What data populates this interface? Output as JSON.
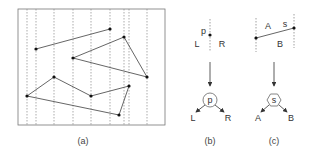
{
  "colors": {
    "stroke": "#555555",
    "dashed": "#888888",
    "point": "#111111",
    "text": "#333333"
  },
  "panel_a": {
    "caption": "(a)",
    "frame": {
      "x": 18,
      "y": 9,
      "w": 147,
      "h": 116
    },
    "sweep_lines_x": [
      27,
      36,
      54,
      73,
      91,
      110,
      124,
      129,
      147
    ],
    "segments": [
      [
        [
          36,
          49
        ],
        [
          110,
          29
        ]
      ],
      [
        [
          73,
          58
        ],
        [
          124,
          37
        ]
      ],
      [
        [
          124,
          37
        ],
        [
          147,
          77
        ]
      ],
      [
        [
          73,
          58
        ],
        [
          147,
          77
        ]
      ],
      [
        [
          27,
          96
        ],
        [
          54,
          77
        ]
      ],
      [
        [
          54,
          77
        ],
        [
          91,
          96
        ]
      ],
      [
        [
          91,
          96
        ],
        [
          129,
          86
        ]
      ],
      [
        [
          129,
          86
        ],
        [
          119,
          115
        ]
      ],
      [
        [
          27,
          96
        ],
        [
          119,
          115
        ]
      ]
    ],
    "points": [
      [
        36,
        49
      ],
      [
        110,
        29
      ],
      [
        73,
        58
      ],
      [
        124,
        37
      ],
      [
        147,
        77
      ],
      [
        27,
        96
      ],
      [
        54,
        77
      ],
      [
        91,
        96
      ],
      [
        129,
        86
      ],
      [
        119,
        115
      ]
    ]
  },
  "panel_b": {
    "caption": "(b)",
    "point_label": "p",
    "left_label": "L",
    "right_label": "R",
    "node_label": "p",
    "child_left": "L",
    "child_right": "R"
  },
  "panel_c": {
    "caption": "(c)",
    "above_label": "A",
    "segment_label": "s",
    "below_label": "B",
    "node_label": "s",
    "child_left": "A",
    "child_right": "B"
  }
}
